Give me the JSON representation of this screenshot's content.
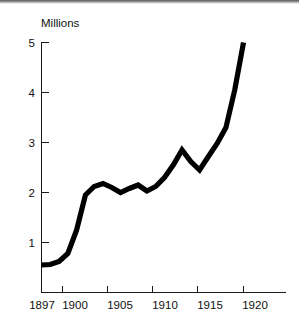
{
  "chart_data": {
    "type": "line",
    "title": "",
    "subtitle": "",
    "xlabel": "",
    "ylabel": "Millions",
    "ylabel_position": "top-left",
    "x": [
      1897,
      1898,
      1899,
      1900,
      1901,
      1902,
      1903,
      1904,
      1905,
      1906,
      1907,
      1908,
      1909,
      1910,
      1911,
      1912,
      1913,
      1914,
      1915,
      1916,
      1917,
      1918,
      1919,
      1920
    ],
    "values": [
      0.55,
      0.56,
      0.62,
      0.78,
      1.25,
      1.95,
      2.12,
      2.18,
      2.1,
      2.0,
      2.08,
      2.15,
      2.03,
      2.12,
      2.3,
      2.55,
      2.85,
      2.62,
      2.45,
      2.72,
      2.98,
      3.3,
      4.05,
      5.0
    ],
    "series": [
      {
        "name": "Millions",
        "color": "#000000",
        "values": [
          0.55,
          0.56,
          0.62,
          0.78,
          1.25,
          1.95,
          2.12,
          2.18,
          2.1,
          2.0,
          2.08,
          2.15,
          2.03,
          2.12,
          2.3,
          2.55,
          2.85,
          2.62,
          2.45,
          2.72,
          2.98,
          3.3,
          4.05,
          5.0
        ]
      }
    ],
    "xlim": [
      1897,
      1920
    ],
    "ylim": [
      0,
      5.35
    ],
    "x_ticks": [
      1897,
      1900,
      1905,
      1910,
      1915,
      1920
    ],
    "x_tick_labels": [
      "1897",
      "1900",
      "1905",
      "1910",
      "1915",
      "1920"
    ],
    "y_ticks": [
      1,
      2,
      3,
      4,
      5
    ],
    "y_tick_labels": [
      "1",
      "2",
      "3",
      "4",
      "5"
    ],
    "grid": false,
    "legend": false,
    "legend_position": "none",
    "annotations": []
  },
  "axes": {
    "y_title": "Millions",
    "y_tick_labels": [
      "5",
      "4",
      "3",
      "2",
      "1"
    ],
    "x_tick_labels": [
      "1897",
      "1900",
      "1905",
      "1910",
      "1915",
      "1920"
    ]
  },
  "colors": {
    "line": "#000000",
    "axis": "#1a1a1a",
    "text": "#101010",
    "background": "#ffffff"
  }
}
